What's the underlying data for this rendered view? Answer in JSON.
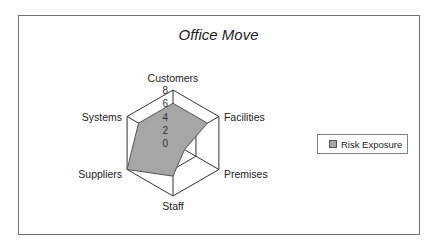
{
  "chart_data": {
    "type": "radar",
    "title": "Office Move",
    "categories": [
      "Customers",
      "Facilities",
      "Premises",
      "Staff",
      "Suppliers",
      "Systems"
    ],
    "series": [
      {
        "name": "Risk Exposure",
        "values": [
          6,
          6,
          2,
          5,
          8,
          6
        ],
        "color": "#a6a6a6"
      }
    ],
    "radial_ticks": [
      "0",
      "2",
      "4",
      "6",
      "8"
    ],
    "range": [
      0,
      8
    ],
    "gridlines": [
      4,
      8
    ],
    "legend_position": "right"
  },
  "legend": {
    "label": "Risk Exposure"
  }
}
